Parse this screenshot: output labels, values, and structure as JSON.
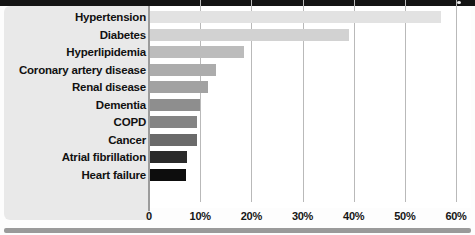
{
  "chart_data": {
    "type": "bar",
    "orientation": "horizontal",
    "title": "",
    "xlabel": "",
    "ylabel": "",
    "xlim": [
      0,
      60
    ],
    "grid": true,
    "legend": false,
    "categories": [
      "Hypertension",
      "Diabetes",
      "Hyperlipidemia",
      "Coronary artery disease",
      "Renal disease",
      "Dementia",
      "COPD",
      "Cancer",
      "Atrial fibrillation",
      "Heart failure"
    ],
    "values": [
      57,
      39,
      18.5,
      13,
      11.5,
      10,
      9.3,
      9.3,
      7.5,
      7.3
    ],
    "value_unit": "%",
    "bar_colors": [
      "#e2e2e2",
      "#d2d2d2",
      "#bcbcbc",
      "#acacac",
      "#a2a2a2",
      "#8e8e8e",
      "#848484",
      "#6a6a6a",
      "#2a2a2a",
      "#0d0d0d"
    ],
    "xticks": [
      0,
      10,
      20,
      30,
      40,
      50,
      60
    ],
    "xtick_labels": [
      "0",
      "10%",
      "20%",
      "30%",
      "40%",
      "50%",
      "60%"
    ]
  },
  "style": {
    "panel_bg": "#e9e9e9",
    "plot_bg": "#ffffff",
    "gridline_color": "#b9b9b9",
    "axis_color": "#9c9c9c",
    "top_band_color": "#141414",
    "bottom_rule_color": "#9a9a9a",
    "label_color": "#111111"
  }
}
